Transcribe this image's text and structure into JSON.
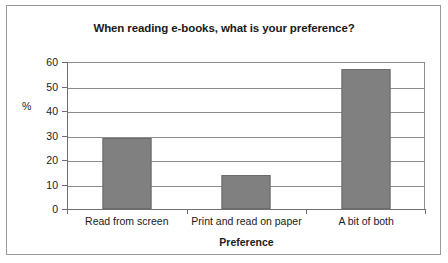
{
  "chart_data": {
    "type": "bar",
    "title": "When reading e-books, what is your preference?",
    "categories": [
      "Read from screen",
      "Print and read on paper",
      "A bit of both"
    ],
    "values": [
      29,
      14,
      57
    ],
    "xlabel": "Preference",
    "ylabel": "%",
    "ylim": [
      0,
      60
    ],
    "yticks": [
      0,
      10,
      20,
      30,
      40,
      50,
      60
    ],
    "ytick_labels": [
      "0",
      "10",
      "20",
      "30",
      "40",
      "50",
      "60"
    ],
    "grid": "horizontal",
    "legend": "none",
    "series": [
      {
        "name": "Preference",
        "values": [
          29,
          14,
          57
        ]
      }
    ],
    "colors": {
      "bar_fill": "#808080",
      "bar_border": "#6b6b6b",
      "gridline": "#8c8c8c",
      "axis": "#6e6e6e",
      "text": "#1a1a1a",
      "frame": "#9a9a9a",
      "background": "#ffffff"
    }
  }
}
